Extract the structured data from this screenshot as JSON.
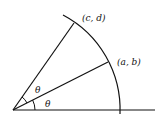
{
  "diagram": {
    "type": "geometry-rotation",
    "points": {
      "cd": {
        "label": "(c, d)"
      },
      "ab": {
        "label": "(a, b)"
      }
    },
    "angles": [
      {
        "label": "θ",
        "position": "between ray to (a, b) and ray to (c, d)"
      },
      {
        "label": "θ",
        "position": "between horizontal axis and ray to (a, b)"
      }
    ],
    "elements": [
      "horizontal axis",
      "circular arc centered at origin",
      "ray to (a, b)",
      "ray to (c, d)"
    ],
    "colors": {
      "stroke": "#111111",
      "background": "#ffffff"
    }
  }
}
